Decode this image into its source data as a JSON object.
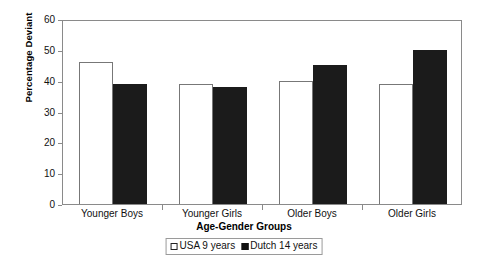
{
  "chart_data": {
    "type": "bar",
    "title": "",
    "xlabel": "Age-Gender Groups",
    "ylabel": "Percentage Deviant",
    "categories": [
      "Younger Boys",
      "Younger Girls",
      "Older Boys",
      "Older Girls"
    ],
    "series": [
      {
        "name": "USA 9 years",
        "values": [
          46,
          39,
          40,
          39
        ],
        "color": "#ffffff",
        "edge_color": "#777777",
        "style": "open"
      },
      {
        "name": "Dutch 14 years",
        "values": [
          39,
          38,
          45,
          50
        ],
        "color": "#1b1b1b",
        "edge_color": "#1b1b1b",
        "style": "filled"
      }
    ],
    "ylim": [
      0,
      60
    ],
    "ytick_labels": [
      "60",
      "50",
      "40",
      "30",
      "20",
      "10",
      "0"
    ],
    "ytick_values": [
      60,
      50,
      40,
      30,
      20,
      10,
      0
    ],
    "ytick_step": 10,
    "grid": false,
    "legend_position": "bottom",
    "frame_color": "#8a8a8a",
    "background": "#ffffff"
  }
}
